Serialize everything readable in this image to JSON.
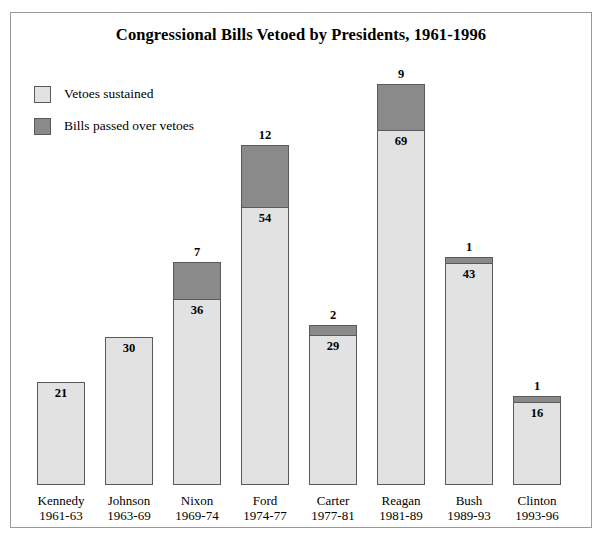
{
  "chart_data": {
    "type": "bar",
    "subtype": "stacked-vertical",
    "title": "Congressional Bills Vetoed by Presidents, 1961-1996",
    "xlabel": "",
    "ylabel": "",
    "grid": false,
    "axis_visible": false,
    "ylim": [
      0,
      78
    ],
    "legend_position": "top-left",
    "categories": [
      "Kennedy",
      "Johnson",
      "Nixon",
      "Ford",
      "Carter",
      "Reagan",
      "Bush",
      "Clinton"
    ],
    "category_sublabels": [
      "1961-63",
      "1963-69",
      "1969-74",
      "1974-77",
      "1977-81",
      "1981-89",
      "1989-93",
      "1993-96"
    ],
    "series": [
      {
        "name": "Vetoes sustained",
        "color": "#e2e2e2",
        "values": [
          21,
          30,
          36,
          54,
          29,
          69,
          43,
          16
        ]
      },
      {
        "name": "Bills passed over vetoes",
        "color": "#8a8a8a",
        "values": [
          0,
          0,
          7,
          12,
          2,
          9,
          1,
          1
        ]
      }
    ],
    "totals": [
      21,
      30,
      43,
      66,
      31,
      78,
      44,
      17
    ]
  },
  "figure": {
    "title": "Congressional Bills Vetoed by Presidents, 1961-1996",
    "border_color": "#9a9a9a",
    "background": "#ffffff"
  },
  "legend": {
    "items": [
      {
        "label": "Vetoes sustained",
        "color": "#e2e2e2"
      },
      {
        "label": "Bills passed over vetoes",
        "color": "#8a8a8a"
      }
    ]
  },
  "bars": [
    {
      "name": "Kennedy",
      "years": "1961-63",
      "light_value": "21",
      "dark_value": "",
      "top_label": "",
      "light_px": 103,
      "dark_px": 0
    },
    {
      "name": "Johnson",
      "years": "1963-69",
      "light_value": "30",
      "dark_value": "",
      "top_label": "",
      "light_px": 148,
      "dark_px": 0
    },
    {
      "name": "Nixon",
      "years": "1969-74",
      "light_value": "36",
      "dark_value": "",
      "top_label": "7",
      "light_px": 185,
      "dark_px": 38
    },
    {
      "name": "Ford",
      "years": "1974-77",
      "light_value": "54",
      "dark_value": "",
      "top_label": "12",
      "light_px": 277,
      "dark_px": 63
    },
    {
      "name": "Carter",
      "years": "1977-81",
      "light_value": "29",
      "dark_value": "",
      "top_label": "2",
      "light_px": 149,
      "dark_px": 11
    },
    {
      "name": "Reagan",
      "years": "1981-89",
      "light_value": "69",
      "dark_value": "",
      "top_label": "9",
      "light_px": 354,
      "dark_px": 47
    },
    {
      "name": "Bush",
      "years": "1989-93",
      "light_value": "43",
      "dark_value": "",
      "top_label": "1",
      "light_px": 221,
      "dark_px": 7
    },
    {
      "name": "Clinton",
      "years": "1993-96",
      "light_value": "16",
      "dark_value": "",
      "top_label": "1",
      "light_px": 82,
      "dark_px": 7
    }
  ],
  "colors": {
    "light_gray": "#e2e2e2",
    "dark_gray": "#8a8a8a",
    "bar_border": "#5a5a5a",
    "frame_border": "#9a9a9a",
    "text": "#000000"
  }
}
